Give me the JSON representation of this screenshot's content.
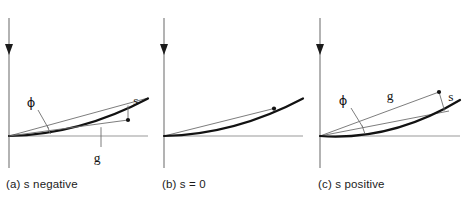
{
  "figure": {
    "background_color": "#ffffff",
    "ink_color": "#141414",
    "thin_line_color": "#8a8a8a",
    "panels": [
      {
        "id": "a",
        "caption": "(a) s negative",
        "labels": {
          "phi": "ϕ",
          "g": "g",
          "s": "s"
        },
        "geometry": {
          "axis_x": 9,
          "axis_top": 18,
          "axis_bottom": 168,
          "arrow_y": 52,
          "baseline_y": 136,
          "baseline_x0": 9,
          "baseline_x1": 148,
          "curve": "M 9 136 Q 78 134 148 98",
          "chord": "M 9 136 L 148 98",
          "marker_dot": [
            128,
            120
          ],
          "s_drop": "M 128 106 L 128 120",
          "g_leader": "M 101 128 L 101 147",
          "phi_leader": "M 38 109 L 48 128",
          "phi_tick": "M 49 126 L 51 134",
          "phi_label_pos": [
            30,
            106
          ],
          "g_label_pos": [
            96,
            160
          ],
          "s_label_pos": [
            133,
            105
          ]
        }
      },
      {
        "id": "b",
        "caption": "(b) s = 0",
        "labels": {},
        "geometry": {
          "axis_x": 9,
          "axis_top": 18,
          "axis_bottom": 168,
          "arrow_y": 52,
          "baseline_y": 136,
          "baseline_x0": 9,
          "baseline_x1": 148,
          "curve": "M 9 136 Q 78 134 148 98",
          "chord": "M 9 136 L 117 109",
          "marker_dot": [
            117,
            109
          ]
        }
      },
      {
        "id": "c",
        "caption": "(c) s positive",
        "labels": {
          "phi": "ϕ",
          "g": "g",
          "s": "s"
        },
        "geometry": {
          "axis_x": 10,
          "axis_top": 18,
          "axis_bottom": 168,
          "arrow_y": 52,
          "baseline_y": 136,
          "baseline_x0": 10,
          "baseline_x1": 150,
          "curve": "M 10 136 Q 80 140 150 100",
          "chord": "M 10 136 L 137 112",
          "g_line": "M 10 136 L 128 92",
          "marker_dot": [
            128,
            92
          ],
          "s_drop": "M 128 92 L 133 111",
          "phi_leader": "M 40 107 L 52 127",
          "phi_tick": "M 52 126 L 54 134",
          "phi_label_pos": [
            32,
            104
          ],
          "g_label_pos": [
            79,
            98
          ],
          "s_label_pos": [
            136,
            101
          ]
        }
      }
    ]
  }
}
